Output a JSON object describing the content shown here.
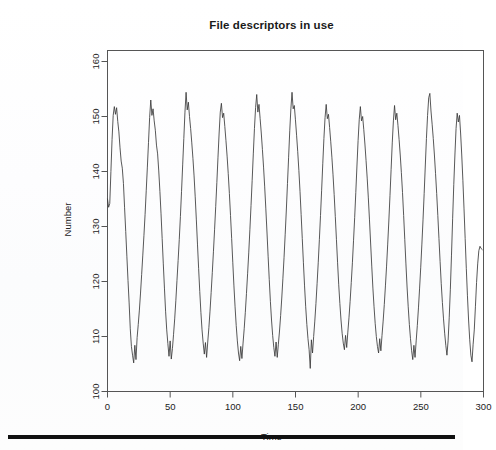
{
  "figure": {
    "title": "File descriptors in use",
    "bottom_rule": "horizontal-rule"
  },
  "chart_data": {
    "type": "line",
    "title": "File descriptors in use",
    "xlabel": "Time",
    "ylabel": "Number",
    "xlim": [
      0,
      300
    ],
    "ylim": [
      100,
      162
    ],
    "xticks": [
      0,
      50,
      100,
      150,
      200,
      250,
      300
    ],
    "yticks": [
      100,
      110,
      120,
      130,
      140,
      150,
      160
    ],
    "grid": false,
    "legend": false,
    "line_color": "#3a3a3a",
    "series": [
      {
        "name": "File descriptors in use",
        "description": "Strongly periodic oscillation, period of about 23 time units, roughly 13 cycles across the 0-300 range, peaks near 148-155 and troughs near 104-110, with fine high-frequency jitter superimposed on the smooth cycle.",
        "period": 23.2,
        "mean": 129.5,
        "amplitude": 22.5,
        "noise_sd": 1.6,
        "x_start": 0,
        "x_end": 299,
        "values": [
          135,
          133.5,
          134.2,
          140,
          145.8,
          150.2,
          151.8,
          150.4,
          151.6,
          149.1,
          147.2,
          144.3,
          141.9,
          140.6,
          137.8,
          133.4,
          129.1,
          124.6,
          120.2,
          116.1,
          111.4,
          108.2,
          106.6,
          105.2,
          108.4,
          105.8,
          109.8,
          112.2,
          114.8,
          117.9,
          121.3,
          124.8,
          128.4,
          132.2,
          136.5,
          140.8,
          145.3,
          149.8,
          153.0,
          150.2,
          151.4,
          149.2,
          147.5,
          144.8,
          143.2,
          140.1,
          136.4,
          132.3,
          127.8,
          123.2,
          118.8,
          114.6,
          111.2,
          108.7,
          106.4,
          109.2,
          105.9,
          107.8,
          110.4,
          113.2,
          116.5,
          120.2,
          123.8,
          127.6,
          131.8,
          136.4,
          141.2,
          146.0,
          150.8,
          154.4,
          151.2,
          152.6,
          150.0,
          147.8,
          145.2,
          142.4,
          139.2,
          135.4,
          131.2,
          126.8,
          122.4,
          118.2,
          114.4,
          111.2,
          108.8,
          106.8,
          108.9,
          106.2,
          109.0,
          111.6,
          114.6,
          118.0,
          121.6,
          125.4,
          129.4,
          133.6,
          138.0,
          142.6,
          147.0,
          150.8,
          152.4,
          149.8,
          150.6,
          148.2,
          145.6,
          142.8,
          139.6,
          136.0,
          132.0,
          127.8,
          123.4,
          119.2,
          115.4,
          112.0,
          109.2,
          107.0,
          105.6,
          108.2,
          106.0,
          108.8,
          111.4,
          114.4,
          117.8,
          121.4,
          125.2,
          129.4,
          133.8,
          138.4,
          143.2,
          147.8,
          151.6,
          154.0,
          150.8,
          152.2,
          149.6,
          147.0,
          144.0,
          140.8,
          137.2,
          133.2,
          129.0,
          124.6,
          120.4,
          116.4,
          113.0,
          110.2,
          108.0,
          106.4,
          109.0,
          106.2,
          108.6,
          111.0,
          113.8,
          117.0,
          120.6,
          124.4,
          128.6,
          133.0,
          137.8,
          142.6,
          147.4,
          151.4,
          154.4,
          151.4,
          152.0,
          149.4,
          146.6,
          143.6,
          140.2,
          136.4,
          132.2,
          127.8,
          123.4,
          119.2,
          115.4,
          112.2,
          109.6,
          107.6,
          104.2,
          109.4,
          107.0,
          110.0,
          112.8,
          116.0,
          119.6,
          123.4,
          127.6,
          132.0,
          136.6,
          141.4,
          146.0,
          149.8,
          152.2,
          149.6,
          150.4,
          148.0,
          145.4,
          142.6,
          139.4,
          135.8,
          131.8,
          127.6,
          123.4,
          119.4,
          116.0,
          113.0,
          110.6,
          108.8,
          107.6,
          110.2,
          108.0,
          110.8,
          113.4,
          116.4,
          119.8,
          123.4,
          127.4,
          131.6,
          136.2,
          141.0,
          145.6,
          149.4,
          151.8,
          149.2,
          150.0,
          147.6,
          145.0,
          142.0,
          138.8,
          135.2,
          131.2,
          127.0,
          122.8,
          118.8,
          115.4,
          112.4,
          110.0,
          108.2,
          107.0,
          109.6,
          107.4,
          110.2,
          112.8,
          115.8,
          119.2,
          122.8,
          126.8,
          131.0,
          135.6,
          140.4,
          145.2,
          149.2,
          152.0,
          149.4,
          150.6,
          148.4,
          145.8,
          143.0,
          139.8,
          136.2,
          132.0,
          127.6,
          123.2,
          119.0,
          115.4,
          112.2,
          109.6,
          107.4,
          105.8,
          108.4,
          106.2,
          109.2,
          112.0,
          115.2,
          118.8,
          122.6,
          126.8,
          131.2,
          136.0,
          141.0,
          146.0,
          150.2,
          153.4,
          154.2,
          151.0,
          148.6,
          146.0,
          143.0,
          139.6,
          136.0,
          132.0,
          127.8,
          123.6,
          119.6,
          116.2,
          113.2,
          110.6,
          108.4,
          106.6,
          109.2,
          113.4,
          118.6,
          124.8,
          131.4,
          137.6,
          143.0,
          147.8,
          150.6,
          149.0,
          150.2,
          147.0,
          143.0,
          138.4,
          133.2,
          127.8,
          122.4,
          117.4,
          113.0,
          109.4,
          106.6,
          105.4,
          108.6,
          111.2,
          115.4,
          119.8,
          123.2,
          125.6,
          126.4,
          126.0,
          125.8
        ]
      }
    ]
  },
  "axes": {
    "x": {
      "label": "Time",
      "ticks": [
        "0",
        "50",
        "100",
        "150",
        "200",
        "250",
        "300"
      ]
    },
    "y": {
      "label": "Number",
      "ticks": [
        "100",
        "110",
        "120",
        "130",
        "140",
        "150",
        "160"
      ]
    }
  }
}
